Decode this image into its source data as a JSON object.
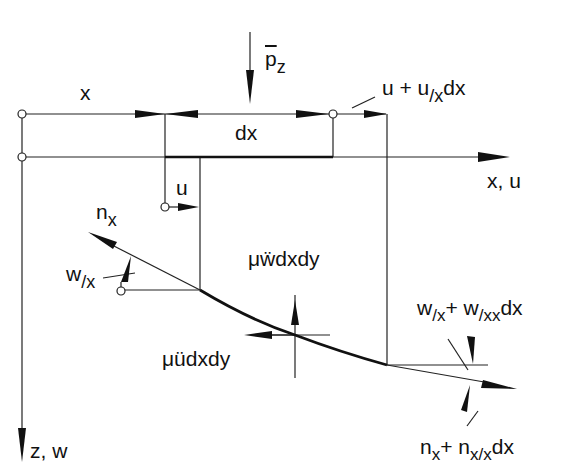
{
  "figure": {
    "type": "free-body diagram of membrane element (plate strip)",
    "colors": {
      "ink": "#111111",
      "background": "#ffffff"
    }
  },
  "labels": {
    "x": "x",
    "dx": "dx",
    "p_main": "p",
    "p_sub": "z",
    "u_plus_main": "u + u",
    "u_plus_sub": "/x",
    "u_plus_tail": "dx",
    "axis_x": "x, u",
    "u": "u",
    "n_main": "n",
    "n_sub": "x",
    "w_main": "w",
    "w_sub": "/x",
    "wdd": "μẅdxdy",
    "udd": "μüdxdy",
    "wslope_a": "w",
    "wslope_a_sub": "/x",
    "wslope_plus": "+ w",
    "wslope_b_sub": "/xx",
    "wslope_tail": "dx",
    "nplus_a": "n",
    "nplus_a_sub": "x",
    "nplus_plus": "+ n",
    "nplus_b_sub": "x/x",
    "nplus_tail": "dx",
    "axis_z": "z, w"
  }
}
